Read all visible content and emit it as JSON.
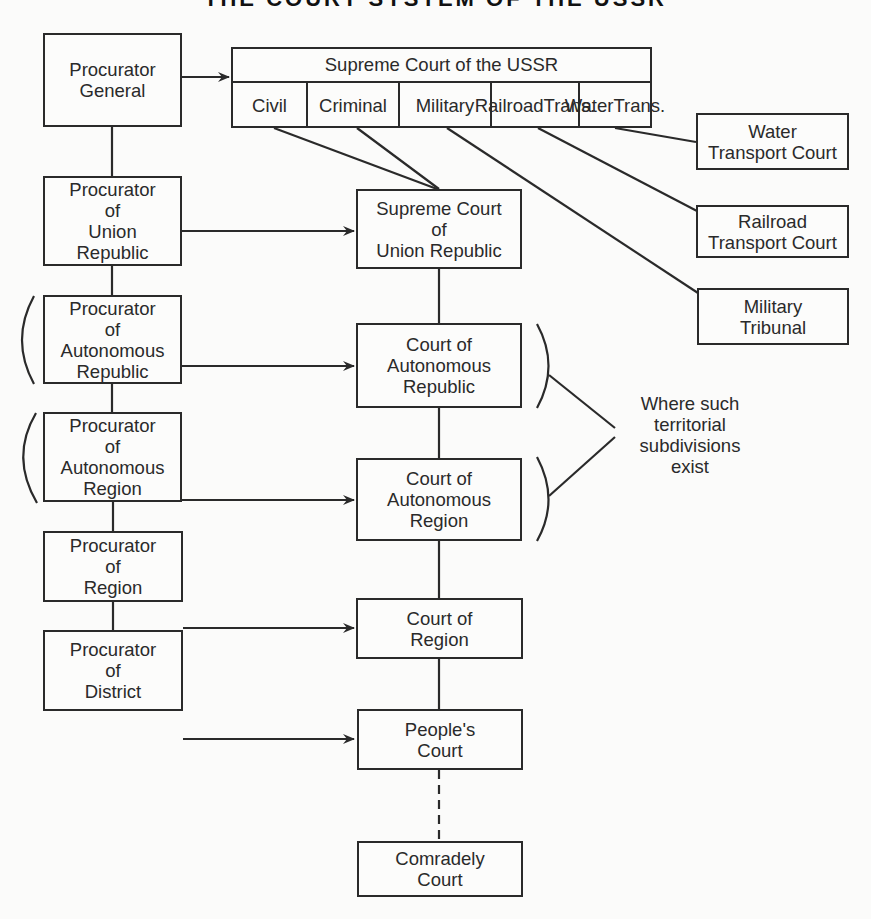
{
  "title": "THE COURT SYSTEM OF THE USSR",
  "procurators": [
    {
      "id": "general",
      "lines": [
        "Procurator",
        "General"
      ]
    },
    {
      "id": "union-republic",
      "lines": [
        "Procurator",
        "of",
        "Union",
        "Republic"
      ]
    },
    {
      "id": "autonomous-republic",
      "lines": [
        "Procurator",
        "of",
        "Autonomous",
        "Republic"
      ]
    },
    {
      "id": "autonomous-region",
      "lines": [
        "Procurator",
        "of",
        "Autonomous",
        "Region"
      ]
    },
    {
      "id": "region",
      "lines": [
        "Procurator",
        "of",
        "Region"
      ]
    },
    {
      "id": "district",
      "lines": [
        "Procurator",
        "of",
        "District"
      ]
    }
  ],
  "supreme_court_ussr": {
    "title": "Supreme Court of the USSR",
    "divisions": [
      {
        "lines": [
          "Civil"
        ]
      },
      {
        "lines": [
          "Criminal"
        ]
      },
      {
        "lines": [
          "Military"
        ]
      },
      {
        "lines": [
          "Railroad",
          "Trans."
        ]
      },
      {
        "lines": [
          "Water",
          "Trans."
        ]
      }
    ]
  },
  "courts": [
    {
      "id": "supreme-union-republic",
      "lines": [
        "Supreme Court",
        "of",
        "Union Republic"
      ]
    },
    {
      "id": "autonomous-republic",
      "lines": [
        "Court of",
        "Autonomous",
        "Republic"
      ]
    },
    {
      "id": "autonomous-region",
      "lines": [
        "Court of",
        "Autonomous",
        "Region"
      ]
    },
    {
      "id": "region",
      "lines": [
        "Court of",
        "Region"
      ]
    },
    {
      "id": "peoples",
      "lines": [
        "People's",
        "Court"
      ]
    },
    {
      "id": "comradely",
      "lines": [
        "Comradely",
        "Court"
      ]
    }
  ],
  "special_courts": [
    {
      "id": "water-transport",
      "lines": [
        "Water",
        "Transport Court"
      ]
    },
    {
      "id": "railroad-transport",
      "lines": [
        "Railroad",
        "Transport Court"
      ]
    },
    {
      "id": "military-tribunal",
      "lines": [
        "Military",
        "Tribunal"
      ]
    }
  ],
  "note": {
    "lines": [
      "Where such",
      "territorial",
      "subdivisions",
      "exist"
    ]
  },
  "colors": {
    "ink": "#2a2a2a",
    "paper": "#fbfbfa"
  }
}
